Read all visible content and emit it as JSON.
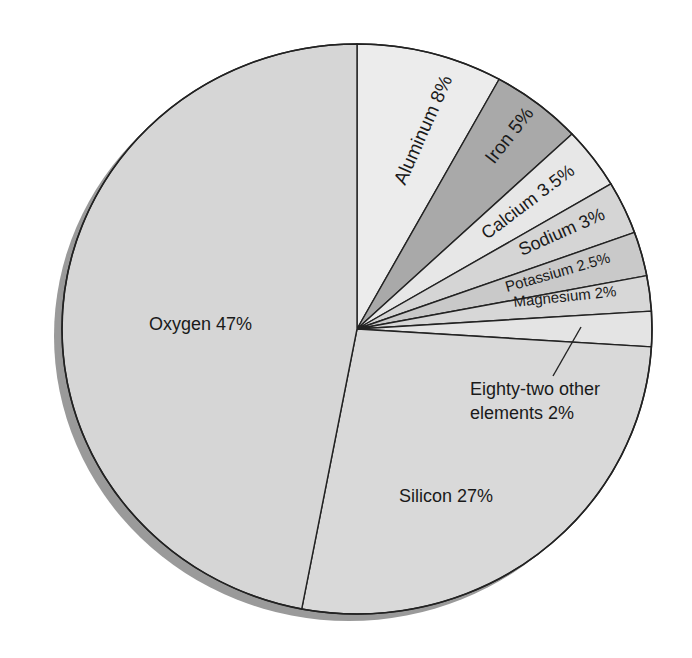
{
  "chart_data": {
    "type": "pie",
    "title": "",
    "start_angle_deg": 0,
    "direction": "clockwise",
    "slices": [
      {
        "name": "Aluminum",
        "value": 8,
        "label": "Aluminum 8%",
        "color": "#ececec"
      },
      {
        "name": "Iron",
        "value": 5,
        "label": "Iron 5%",
        "color": "#a9a9a9"
      },
      {
        "name": "Calcium",
        "value": 3.5,
        "label": "Calcium 3.5%",
        "color": "#e7e7e7"
      },
      {
        "name": "Sodium",
        "value": 3,
        "label": "Sodium 3%",
        "color": "#d5d5d5"
      },
      {
        "name": "Potassium",
        "value": 2.5,
        "label": "Potassium 2.5%",
        "color": "#c9c9c9"
      },
      {
        "name": "Magnesium",
        "value": 2,
        "label": "Magnesium 2%",
        "color": "#d7d7d7"
      },
      {
        "name": "Eighty-two other elements",
        "value": 2,
        "label": "Eighty-two other elements 2%",
        "color": "#e4e4e4"
      },
      {
        "name": "Silicon",
        "value": 27,
        "label": "Silicon 27%",
        "color": "#d9d9d9"
      },
      {
        "name": "Oxygen",
        "value": 47,
        "label": "Oxygen 47%",
        "color": "#d6d6d6"
      }
    ],
    "labels": {
      "aluminum": "Aluminum 8%",
      "iron": "Iron 5%",
      "calcium": "Calcium 3.5%",
      "sodium": "Sodium 3%",
      "potassium": "Potassium 2.5%",
      "magnesium": "Magnesium 2%",
      "other_line1": "Eighty-two other",
      "other_line2": "elements 2%",
      "silicon": "Silicon 27%",
      "oxygen": "Oxygen 47%"
    },
    "legend": "none",
    "grid": false,
    "shadow_color": "#9a9a9a",
    "outline_color": "#222222"
  }
}
